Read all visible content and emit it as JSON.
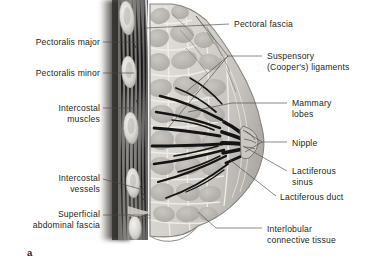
{
  "figure": {
    "panel_letter": "a",
    "background_color": "#ffffff",
    "text_color": "#231f20",
    "leader_line_color": "#4a4a4a"
  },
  "labels_left": [
    {
      "id": "pectoralis-major",
      "text": "Pectoralis major",
      "x": 18,
      "y": 37,
      "width": 82,
      "align": "right",
      "leader": {
        "x1": 103,
        "y1": 42,
        "x2": 140,
        "y2": 42
      }
    },
    {
      "id": "pectoralis-minor",
      "text": "Pectoralis minor",
      "x": 18,
      "y": 68,
      "width": 82,
      "align": "right",
      "leader": {
        "x1": 103,
        "y1": 73,
        "x2": 134,
        "y2": 73
      }
    },
    {
      "id": "intercostal-muscles",
      "text": "Intercostal\nmuscles",
      "x": 20,
      "y": 103,
      "width": 80,
      "align": "right",
      "leader": {
        "x1": 103,
        "y1": 108,
        "x2": 134,
        "y2": 108
      }
    },
    {
      "id": "intercostal-vessels",
      "text": "Intercostal\nvessels",
      "x": 20,
      "y": 173,
      "width": 80,
      "align": "right",
      "leader": {
        "x1": 103,
        "y1": 179,
        "x2": 144,
        "y2": 190
      }
    },
    {
      "id": "superficial-abdominal-fascia",
      "text": "Superficial\nabdominal fascia",
      "x": 10,
      "y": 209,
      "width": 90,
      "align": "right",
      "leader": {
        "x1": 103,
        "y1": 215,
        "x2": 150,
        "y2": 215
      }
    }
  ],
  "labels_right": [
    {
      "id": "pectoral-fascia",
      "text": "Pectoral fascia",
      "x": 234,
      "y": 19,
      "width": 130,
      "align": "left",
      "leader": {
        "x1": 229,
        "y1": 24,
        "x2": 146,
        "y2": 28
      }
    },
    {
      "id": "suspensory-coopers-ligaments",
      "text": "Suspensory\n(Cooper's) ligaments",
      "x": 267,
      "y": 51,
      "width": 98,
      "align": "left",
      "leader": {
        "x1": 262,
        "y1": 56,
        "x2": 228,
        "y2": 56
      }
    },
    {
      "id": "mammary-lobes",
      "text": "Mammary\nlobes",
      "x": 292,
      "y": 98,
      "width": 72,
      "align": "left",
      "leader": {
        "x1": 287,
        "y1": 103,
        "x2": 232,
        "y2": 103
      }
    },
    {
      "id": "nipple",
      "text": "Nipple",
      "x": 292,
      "y": 138,
      "width": 72,
      "align": "left",
      "leader": {
        "x1": 287,
        "y1": 142,
        "x2": 262,
        "y2": 142
      }
    },
    {
      "id": "lactiferous-sinus",
      "text": "Lactiferous\nsinus",
      "x": 292,
      "y": 166,
      "width": 72,
      "align": "left",
      "leader": {
        "x1": 287,
        "y1": 171,
        "x2": 243,
        "y2": 146
      }
    },
    {
      "id": "lactiferous-duct",
      "text": "Lactiferous duct",
      "x": 280,
      "y": 192,
      "width": 86,
      "align": "left",
      "leader": {
        "x1": 276,
        "y1": 196,
        "x2": 232,
        "y2": 161
      }
    },
    {
      "id": "interlobular-connective-tissue",
      "text": "Interlobular\nconnective tissue",
      "x": 267,
      "y": 224,
      "width": 98,
      "align": "left",
      "leader": {
        "x1": 262,
        "y1": 228,
        "x2": 216,
        "y2": 228
      }
    }
  ],
  "anatomy_regions": [
    {
      "id": "chest-cavity-shadow",
      "label": "Chest cavity (dark shadow)",
      "fill": "#3a3a3a"
    },
    {
      "id": "rib-cross-sections",
      "label": "Rib cross sections",
      "fill": "#e4e2de",
      "count": 4
    },
    {
      "id": "pectoralis-major-muscle",
      "label": "Pectoralis major muscle layer",
      "fill": "#9a9a99"
    },
    {
      "id": "pectoralis-minor-muscle",
      "label": "Pectoralis minor muscle layer",
      "fill": "#8c8c8b"
    },
    {
      "id": "pectoral-fascia-layer",
      "label": "Pectoral fascia",
      "fill": "#d6d4d0"
    },
    {
      "id": "mammary-gland-body",
      "label": "Mammary gland body / breast tissue",
      "fill": "#d9d6d1"
    },
    {
      "id": "lobule-cluster",
      "label": "Mammary lobes (fat/glandular lobules)",
      "fill": "#b9b6b1"
    },
    {
      "id": "duct-system",
      "label": "Lactiferous ducts and sinuses",
      "fill": "#1a1a1a"
    },
    {
      "id": "nipple-papilla",
      "label": "Nipple",
      "fill": "#c9c5c0"
    },
    {
      "id": "skin-outline",
      "label": "Skin / breast contour",
      "fill": "#b4b1ac"
    }
  ]
}
